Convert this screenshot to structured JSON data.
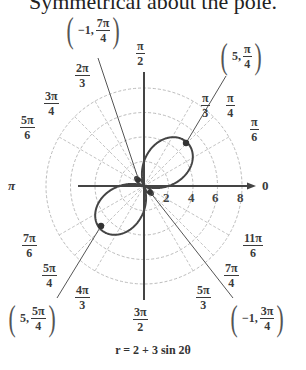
{
  "header": {
    "text": "Symmetrical about the pole."
  },
  "caption": {
    "text": "r = 2 + 3 sin 2θ"
  },
  "angle_labels": [
    {
      "id": "pi-2",
      "num": "π",
      "den": "2"
    },
    {
      "id": "2pi-3",
      "num": "2π",
      "den": "3"
    },
    {
      "id": "3pi-4",
      "num": "3π",
      "den": "4"
    },
    {
      "id": "5pi-6",
      "num": "5π",
      "den": "6"
    },
    {
      "id": "pi-3",
      "num": "π",
      "den": "3"
    },
    {
      "id": "pi-4",
      "num": "π",
      "den": "4"
    },
    {
      "id": "pi-6",
      "num": "π",
      "den": "6"
    },
    {
      "id": "7pi-6",
      "num": "7π",
      "den": "6"
    },
    {
      "id": "5pi-4",
      "num": "5π",
      "den": "4"
    },
    {
      "id": "4pi-3",
      "num": "4π",
      "den": "3"
    },
    {
      "id": "3pi-2",
      "num": "3π",
      "den": "2"
    },
    {
      "id": "5pi-3",
      "num": "5π",
      "den": "3"
    },
    {
      "id": "7pi-4",
      "num": "7π",
      "den": "4"
    },
    {
      "id": "11pi-6",
      "num": "11π",
      "den": "6"
    }
  ],
  "axis_labels": {
    "pi": "π",
    "zero": "0"
  },
  "radial_ticks": [
    "2",
    "4",
    "6",
    "8"
  ],
  "points": [
    {
      "id": "p-neg1-7pi4",
      "r": "−1,",
      "num": "7π",
      "den": "4"
    },
    {
      "id": "p-5-pi4",
      "r": "5,",
      "num": "π",
      "den": "4"
    },
    {
      "id": "p-5-5pi4",
      "r": "5,",
      "num": "5π",
      "den": "4"
    },
    {
      "id": "p-neg1-3pi4",
      "r": "−1,",
      "num": "3π",
      "den": "4"
    }
  ],
  "chart_data": {
    "type": "line",
    "title": "r = 2 + 3 sin 2θ",
    "subtitle": "Symmetrical about the pole.",
    "coordinate_system": "polar",
    "equation": "r = 2 + 3 sin 2θ",
    "radial_ticks": [
      2,
      4,
      6,
      8
    ],
    "rlim": [
      0,
      8
    ],
    "angle_ticks": [
      "0",
      "π/6",
      "π/4",
      "π/3",
      "π/2",
      "2π/3",
      "3π/4",
      "5π/6",
      "π",
      "7π/6",
      "5π/4",
      "4π/3",
      "3π/2",
      "5π/3",
      "7π/4",
      "11π/6"
    ],
    "grid": true,
    "highlighted_points": [
      {
        "r": -1,
        "theta": "7π/4"
      },
      {
        "r": 5,
        "theta": "π/4"
      },
      {
        "r": 5,
        "theta": "5π/4"
      },
      {
        "r": -1,
        "theta": "3π/4"
      }
    ],
    "series": [
      {
        "name": "r = 2 + 3 sin 2θ",
        "theta_range": [
          0,
          "2π"
        ],
        "sample": [
          {
            "theta": "0",
            "r": 2
          },
          {
            "theta": "π/4",
            "r": 5
          },
          {
            "theta": "π/2",
            "r": 2
          },
          {
            "theta": "3π/4",
            "r": -1
          },
          {
            "theta": "π",
            "r": 2
          },
          {
            "theta": "5π/4",
            "r": 5
          },
          {
            "theta": "3π/2",
            "r": 2
          },
          {
            "theta": "7π/4",
            "r": -1
          }
        ]
      }
    ]
  }
}
